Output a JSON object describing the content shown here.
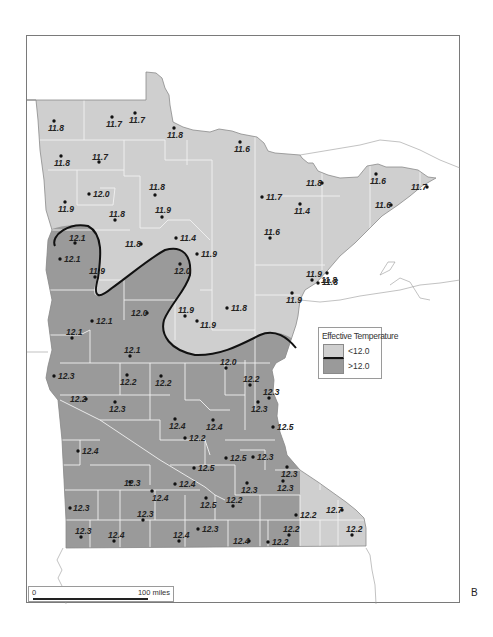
{
  "figure": {
    "panel_letter": "B",
    "legend": {
      "title": "Effective Temperature",
      "items": [
        {
          "label": "<12.0",
          "color": "#cfcfcf"
        },
        {
          "label": ">12.0",
          "color": "#9a9a9a"
        }
      ]
    },
    "scale_bar": {
      "start_label": "0",
      "end_label": "100 miles"
    },
    "colors": {
      "low_fill": "#cfcfcf",
      "high_fill": "#9a9a9a",
      "county_lines": "#eeeeee",
      "contour": "#111111",
      "outline": "#8a8a8a"
    }
  },
  "stations": [
    {
      "x": 54,
      "y": 121,
      "value": "11.8",
      "lx": 48,
      "ly": 131
    },
    {
      "x": 112,
      "y": 117,
      "value": "11.7",
      "lx": 106,
      "ly": 127
    },
    {
      "x": 135,
      "y": 113,
      "value": "11.7",
      "lx": 129,
      "ly": 123
    },
    {
      "x": 174,
      "y": 128,
      "value": "11.8",
      "lx": 167,
      "ly": 138
    },
    {
      "x": 240,
      "y": 142,
      "value": "11.6",
      "lx": 234,
      "ly": 152
    },
    {
      "x": 61,
      "y": 156,
      "value": "11.8",
      "lx": 54,
      "ly": 166
    },
    {
      "x": 99,
      "y": 162,
      "value": "11.7",
      "lx": 92,
      "ly": 160
    },
    {
      "x": 89,
      "y": 194,
      "value": "12.0",
      "lx": 93,
      "ly": 197
    },
    {
      "x": 155,
      "y": 195,
      "value": "11.8",
      "lx": 149,
      "ly": 190
    },
    {
      "x": 65,
      "y": 202,
      "value": "11.9",
      "lx": 58,
      "ly": 212
    },
    {
      "x": 115,
      "y": 220,
      "value": "11.8",
      "lx": 109,
      "ly": 217
    },
    {
      "x": 162,
      "y": 217,
      "value": "11.9",
      "lx": 155,
      "ly": 213
    },
    {
      "x": 262,
      "y": 197,
      "value": "11.7",
      "lx": 266,
      "ly": 200
    },
    {
      "x": 300,
      "y": 204,
      "value": "11.4",
      "lx": 294,
      "ly": 214
    },
    {
      "x": 322,
      "y": 183,
      "value": "11.8",
      "lx": 306,
      "ly": 186
    },
    {
      "x": 376,
      "y": 174,
      "value": "11.6",
      "lx": 370,
      "ly": 184
    },
    {
      "x": 427,
      "y": 187,
      "value": "11.7",
      "lx": 411,
      "ly": 190
    },
    {
      "x": 391,
      "y": 205,
      "value": "11.6",
      "lx": 375,
      "ly": 208
    },
    {
      "x": 270,
      "y": 238,
      "value": "11.6",
      "lx": 264,
      "ly": 235
    },
    {
      "x": 176,
      "y": 238,
      "value": "11.4",
      "lx": 180,
      "ly": 241
    },
    {
      "x": 141,
      "y": 244,
      "value": "11.8",
      "lx": 125,
      "ly": 247
    },
    {
      "x": 197,
      "y": 254,
      "value": "11.9",
      "lx": 201,
      "ly": 257
    },
    {
      "x": 180,
      "y": 264,
      "value": "12.0",
      "lx": 174,
      "ly": 274
    },
    {
      "x": 75,
      "y": 243,
      "value": "12.1",
      "lx": 69,
      "ly": 241
    },
    {
      "x": 60,
      "y": 259,
      "value": "12.1",
      "lx": 64,
      "ly": 262
    },
    {
      "x": 95,
      "y": 277,
      "value": "11.9",
      "lx": 89,
      "ly": 274
    },
    {
      "x": 327,
      "y": 273,
      "value": "11.8",
      "lx": 321,
      "ly": 283
    },
    {
      "x": 312,
      "y": 280,
      "value": "11.9",
      "lx": 306,
      "ly": 277
    },
    {
      "x": 318,
      "y": 283,
      "value": "11.8",
      "lx": 322,
      "ly": 285
    },
    {
      "x": 292,
      "y": 293,
      "value": "11.9",
      "lx": 286,
      "ly": 303
    },
    {
      "x": 92,
      "y": 321,
      "value": "12.1",
      "lx": 96,
      "ly": 324
    },
    {
      "x": 147,
      "y": 313,
      "value": "12.0",
      "lx": 131,
      "ly": 316
    },
    {
      "x": 185,
      "y": 316,
      "value": "11.9",
      "lx": 178,
      "ly": 313
    },
    {
      "x": 197,
      "y": 321,
      "value": "11.9",
      "lx": 200,
      "ly": 328
    },
    {
      "x": 227,
      "y": 308,
      "value": "11.8",
      "lx": 231,
      "ly": 311
    },
    {
      "x": 72,
      "y": 338,
      "value": "12.1",
      "lx": 66,
      "ly": 335
    },
    {
      "x": 130,
      "y": 356,
      "value": "12.1",
      "lx": 124,
      "ly": 353
    },
    {
      "x": 226,
      "y": 368,
      "value": "12.0",
      "lx": 220,
      "ly": 365
    },
    {
      "x": 54,
      "y": 376,
      "value": "12.3",
      "lx": 58,
      "ly": 379
    },
    {
      "x": 127,
      "y": 375,
      "value": "12.2",
      "lx": 120,
      "ly": 385
    },
    {
      "x": 161,
      "y": 376,
      "value": "12.2",
      "lx": 155,
      "ly": 386
    },
    {
      "x": 250,
      "y": 385,
      "value": "12.2",
      "lx": 243,
      "ly": 382
    },
    {
      "x": 86,
      "y": 399,
      "value": "12.2",
      "lx": 70,
      "ly": 402
    },
    {
      "x": 115,
      "y": 402,
      "value": "12.3",
      "lx": 109,
      "ly": 412
    },
    {
      "x": 258,
      "y": 402,
      "value": "12.3",
      "lx": 251,
      "ly": 412
    },
    {
      "x": 269,
      "y": 398,
      "value": "12.3",
      "lx": 263,
      "ly": 395
    },
    {
      "x": 175,
      "y": 419,
      "value": "12.4",
      "lx": 169,
      "ly": 429
    },
    {
      "x": 213,
      "y": 420,
      "value": "12.4",
      "lx": 206,
      "ly": 430
    },
    {
      "x": 273,
      "y": 427,
      "value": "12.5",
      "lx": 277,
      "ly": 430
    },
    {
      "x": 185,
      "y": 438,
      "value": "12.2",
      "lx": 189,
      "ly": 441
    },
    {
      "x": 78,
      "y": 451,
      "value": "12.4",
      "lx": 82,
      "ly": 454
    },
    {
      "x": 226,
      "y": 458,
      "value": "12.5",
      "lx": 230,
      "ly": 461
    },
    {
      "x": 253,
      "y": 457,
      "value": "12.3",
      "lx": 257,
      "ly": 460
    },
    {
      "x": 194,
      "y": 468,
      "value": "12.5",
      "lx": 198,
      "ly": 471
    },
    {
      "x": 287,
      "y": 467,
      "value": "12.3",
      "lx": 281,
      "ly": 477
    },
    {
      "x": 247,
      "y": 483,
      "value": "12.3",
      "lx": 241,
      "ly": 493
    },
    {
      "x": 130,
      "y": 482,
      "value": "12.3",
      "lx": 124,
      "ly": 486
    },
    {
      "x": 152,
      "y": 491,
      "value": "12.4",
      "lx": 152,
      "ly": 501
    },
    {
      "x": 175,
      "y": 484,
      "value": "12.4",
      "lx": 179,
      "ly": 487
    },
    {
      "x": 283,
      "y": 481,
      "value": "12.3",
      "lx": 277,
      "ly": 491
    },
    {
      "x": 206,
      "y": 498,
      "value": "12.5",
      "lx": 200,
      "ly": 508
    },
    {
      "x": 233,
      "y": 506,
      "value": "12.2",
      "lx": 226,
      "ly": 503
    },
    {
      "x": 70,
      "y": 508,
      "value": "12.3",
      "lx": 73,
      "ly": 511
    },
    {
      "x": 143,
      "y": 520,
      "value": "12.3",
      "lx": 137,
      "ly": 517
    },
    {
      "x": 296,
      "y": 515,
      "value": "12.2",
      "lx": 300,
      "ly": 518
    },
    {
      "x": 342,
      "y": 510,
      "value": "12.7",
      "lx": 326,
      "ly": 513
    },
    {
      "x": 81,
      "y": 537,
      "value": "12.3",
      "lx": 75,
      "ly": 534
    },
    {
      "x": 114,
      "y": 541,
      "value": "12.4",
      "lx": 108,
      "ly": 538
    },
    {
      "x": 179,
      "y": 541,
      "value": "12.4",
      "lx": 173,
      "ly": 538
    },
    {
      "x": 198,
      "y": 529,
      "value": "12.3",
      "lx": 202,
      "ly": 532
    },
    {
      "x": 249,
      "y": 541,
      "value": "12.4",
      "lx": 233,
      "ly": 544
    },
    {
      "x": 268,
      "y": 542,
      "value": "12.2",
      "lx": 272,
      "ly": 545
    },
    {
      "x": 289,
      "y": 535,
      "value": "12.2",
      "lx": 283,
      "ly": 532
    },
    {
      "x": 352,
      "y": 535,
      "value": "12.2",
      "lx": 346,
      "ly": 532
    }
  ]
}
